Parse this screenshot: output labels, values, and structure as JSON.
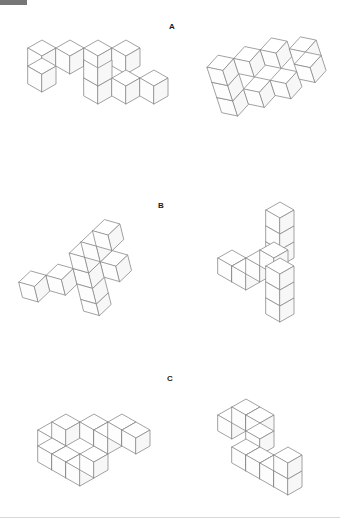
{
  "page": {
    "background_color": "#ffffff",
    "line_color": "#8a8a8a",
    "top_bar_color": "#767676",
    "rule_color": "#d8d8d8",
    "width": 340,
    "height": 530
  },
  "items": [
    {
      "label": "A",
      "left_figure_name": "item-a-left-cube-figure",
      "right_figure_name": "item-a-right-cube-figure",
      "left_description": "Z-shaped assembly of unit cubes drawn in isometric projection",
      "right_description": "Rotated Z-shaped assembly of unit cubes drawn in isometric projection"
    },
    {
      "label": "B",
      "left_figure_name": "item-b-left-cube-figure",
      "right_figure_name": "item-b-right-cube-figure",
      "left_description": "T-shaped assembly of unit cubes with a vertical arm, isometric projection",
      "right_description": "Rotated T-shaped assembly of unit cubes with a vertical arm, isometric projection"
    },
    {
      "label": "C",
      "left_figure_name": "item-c-left-cube-figure",
      "right_figure_name": "item-c-right-cube-figure",
      "left_description": "S/Z-shaped flat assembly of unit cubes, isometric projection",
      "right_description": "Rotated S/Z-shaped assembly of unit cubes, isometric projection"
    }
  ]
}
